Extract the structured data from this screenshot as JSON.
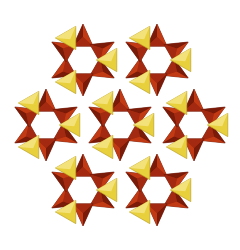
{
  "diagram": {
    "type": "polyhedral-crystal-structure",
    "background": "#ffffff",
    "colors": {
      "tetra_dark": "#7a1a08",
      "tetra_mid": "#a32a10",
      "tetra_light": "#c23a14",
      "tetra_edge": "#5a1204",
      "yellow": "#e8cf3c",
      "yellow_light": "#f3e27a",
      "yellow_edge": "#b59a1e"
    },
    "ring_radius": 27,
    "tetra_size": 13,
    "rings": [
      {
        "id": "ring-top-left",
        "cx": 83,
        "cy": 60
      },
      {
        "id": "ring-top-right",
        "cx": 157,
        "cy": 60
      },
      {
        "id": "ring-mid-left",
        "cx": 46,
        "cy": 125
      },
      {
        "id": "ring-mid-center",
        "cx": 120,
        "cy": 125
      },
      {
        "id": "ring-mid-right",
        "cx": 194,
        "cy": 125
      },
      {
        "id": "ring-bottom-left",
        "cx": 83,
        "cy": 190
      },
      {
        "id": "ring-bottom-right",
        "cx": 157,
        "cy": 190
      }
    ]
  }
}
